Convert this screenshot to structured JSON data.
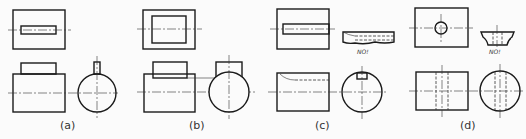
{
  "figure": {
    "type": "orthographic-projection-examples",
    "panels": [
      {
        "id": "a",
        "label": "(a)",
        "description": "Rectangular block with rectangular key on top; top view shows slot, side view circle with narrow key"
      },
      {
        "id": "b",
        "label": "(b)",
        "description": "Rectangular block with wide rectangular boss; top view shows inner rectangle, side view circle with wide rectangle"
      },
      {
        "id": "c",
        "label": "(c)",
        "description": "Cylinder with keyway slot; incorrect section marked NO!",
        "annotation": "NO!"
      },
      {
        "id": "d",
        "label": "(d)",
        "description": "Cylinder with transverse hole; incorrect section marked NO!",
        "annotation": "NO!"
      }
    ]
  },
  "colors": {
    "line": "#1a1a1a",
    "background": "#fbfbfb"
  }
}
